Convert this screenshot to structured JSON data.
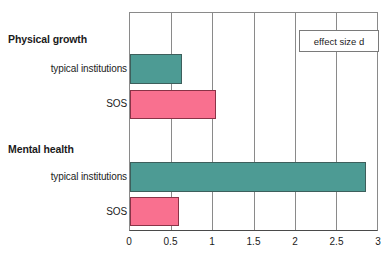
{
  "chart_data": {
    "type": "bar",
    "orientation": "horizontal",
    "title": "",
    "xlabel": "",
    "ylabel": "",
    "xlim": [
      0,
      3
    ],
    "xticks": [
      "0",
      "0.5",
      "1",
      "1.5",
      "2",
      "2.5",
      "3"
    ],
    "xtick_values": [
      0,
      0.5,
      1,
      1.5,
      2,
      2.5,
      3
    ],
    "grid": true,
    "legend": {
      "position": "top-right",
      "entries": [
        "effect size d"
      ],
      "label": "effect size d"
    },
    "groups": [
      {
        "label": "Physical growth",
        "bars": [
          {
            "label": "typical institutions",
            "value": 0.63,
            "color": "#4d9b94",
            "series": "typical institutions"
          },
          {
            "label": "SOS",
            "value": 1.05,
            "color": "#f9708f",
            "series": "SOS"
          }
        ]
      },
      {
        "label": "Mental health",
        "bars": [
          {
            "label": "typical institutions",
            "value": 2.87,
            "color": "#4d9b94",
            "series": "typical institutions"
          },
          {
            "label": "SOS",
            "value": 0.6,
            "color": "#f9708f",
            "series": "SOS"
          }
        ]
      }
    ],
    "categories": [
      "Physical growth / typical institutions",
      "Physical growth / SOS",
      "Mental health / typical institutions",
      "Mental health / SOS"
    ],
    "values": [
      0.63,
      1.05,
      2.87,
      0.6
    ],
    "colors": {
      "teal": "#4d9b94",
      "pink": "#f9708f",
      "axis": "#4a4a4a",
      "grid": "#8a8a8a",
      "text": "#1b1b1b",
      "background": "#ffffff"
    }
  },
  "labels": {
    "group_physical": "Physical growth",
    "group_mental": "Mental health",
    "row1": "typical institutions",
    "row2": "SOS",
    "row3": "typical institutions",
    "row4": "SOS"
  },
  "axis": {
    "t0": "0",
    "t1": "0.5",
    "t2": "1",
    "t3": "1.5",
    "t4": "2",
    "t5": "2.5",
    "t6": "3"
  }
}
